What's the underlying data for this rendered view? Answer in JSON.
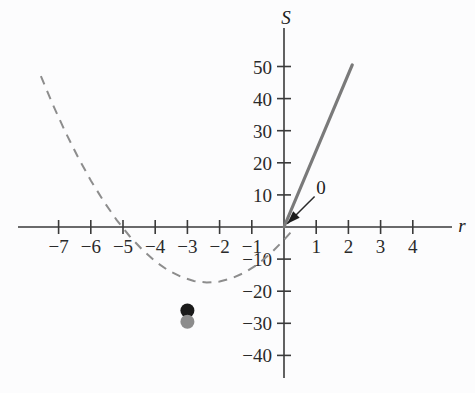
{
  "chart_data": {
    "type": "line",
    "title": "",
    "xlabel": "r",
    "ylabel": "S",
    "xlim": [
      -8.0,
      5.0
    ],
    "ylim": [
      -46,
      57
    ],
    "grid": false,
    "legend": "none",
    "x_ticks": [
      -7,
      -6,
      -5,
      -4,
      -3,
      -2,
      -1,
      1,
      2,
      3,
      4
    ],
    "x_tick_labels": [
      "−7",
      "−6",
      "−5",
      "−4",
      "−3",
      "−2",
      "−1",
      "1",
      "2",
      "3",
      "4"
    ],
    "y_ticks": [
      50,
      40,
      30,
      20,
      10,
      -10,
      -20,
      -30,
      -40
    ],
    "y_tick_labels": [
      "50",
      "40",
      "30",
      "20",
      "10",
      "−10",
      "−20",
      "−30",
      "−40"
    ],
    "series": [
      {
        "name": "dashed-parabola",
        "style": "dashed",
        "color": "#8d8d8d",
        "x": [
          -7.55,
          -7.2,
          -6.8,
          -6.4,
          -6.0,
          -5.6,
          -5.2,
          -4.8,
          -4.4,
          -4.0,
          -3.6,
          -3.2,
          -2.8,
          -2.4,
          -2.0,
          -1.6,
          -1.2,
          -0.8,
          -0.4,
          0.0,
          0.25
        ],
        "y": [
          47.0,
          38.6,
          29.8,
          21.8,
          14.5,
          8.0,
          2.2,
          -2.8,
          -7.1,
          -10.7,
          -13.5,
          -15.5,
          -16.8,
          -17.3,
          -17.0,
          -15.9,
          -14.1,
          -11.5,
          -8.1,
          -4.0,
          -1.2
        ]
      },
      {
        "name": "solid-line",
        "style": "solid",
        "color": "#7a7a7a",
        "x": [
          0.0,
          2.12
        ],
        "y": [
          0.0,
          50.5
        ]
      }
    ],
    "points": [
      {
        "name": "black-dot",
        "x": -3.0,
        "y": -26.0,
        "color": "#1a1a1a",
        "radius_px": 7
      },
      {
        "name": "gray-dot",
        "x": -3.0,
        "y": -29.5,
        "color": "#8c8c8c",
        "radius_px": 7
      }
    ],
    "annotations": [
      {
        "name": "origin-callout",
        "text": "0",
        "label_x": 1.15,
        "label_y": 12.5,
        "arrow_from_x": 0.95,
        "arrow_from_y": 9.5,
        "arrow_to_x": 0.1,
        "arrow_to_y": 1.0
      }
    ]
  },
  "axis": {
    "y_name": "S",
    "x_name": "r"
  }
}
